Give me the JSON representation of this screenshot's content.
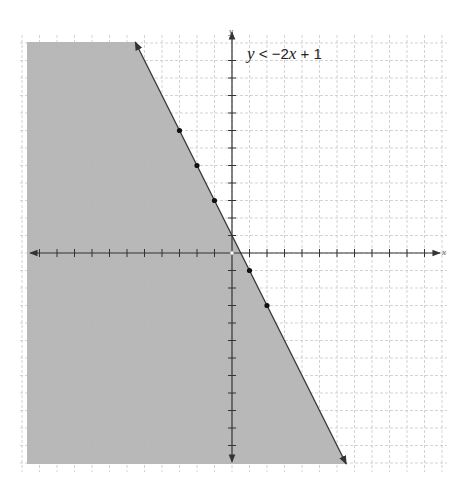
{
  "chart_data": {
    "type": "inequality-graph",
    "inequality": {
      "lhs": "y",
      "operator": "<",
      "rhs": "-2x + 1",
      "slope": -2,
      "intercept": 1,
      "boundary_style": "solid",
      "shaded_side": "below"
    },
    "xlabel": "x",
    "ylabel": "y",
    "xlim": [
      -11.5,
      11.5
    ],
    "ylim": [
      -12,
      12.5
    ],
    "grid": true,
    "grid_style": "dashed",
    "tick_step": 1,
    "points": [
      {
        "x": -3,
        "y": 7
      },
      {
        "x": -2,
        "y": 5
      },
      {
        "x": -1,
        "y": 3
      },
      {
        "x": 1,
        "y": -1
      },
      {
        "x": 2,
        "y": -3
      }
    ],
    "open_points": [
      {
        "x": 0,
        "y": 0
      }
    ],
    "colors": {
      "shade": "#b4b4b4",
      "line": "#333333",
      "grid": "#c8c8c8",
      "axis": "#333333",
      "point": "#111111"
    }
  },
  "labels": {
    "equation_y": "y",
    "equation_op": " < −2",
    "equation_x": "x",
    "equation_tail": " + 1",
    "x_axis": "x",
    "y_axis": "y"
  }
}
